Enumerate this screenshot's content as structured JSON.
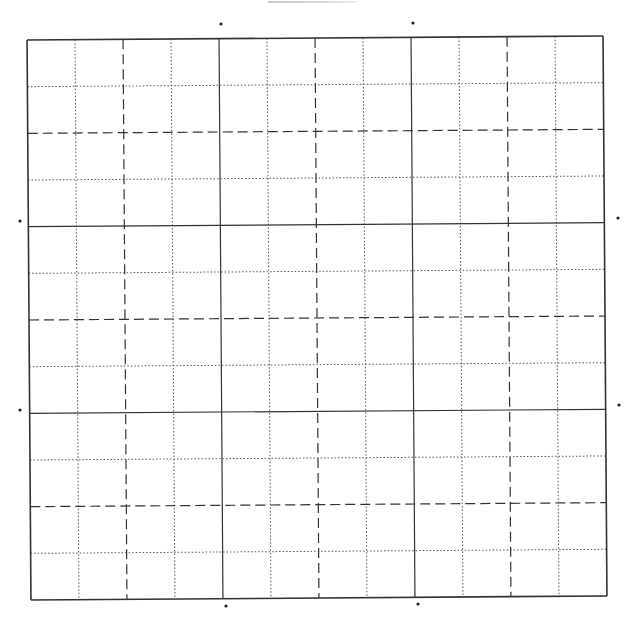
{
  "page": {
    "header_text": ""
  },
  "grid": {
    "origin": [
      29,
      38
    ],
    "width": 576,
    "height": 560,
    "rotation_deg": -0.4,
    "columns": 12,
    "rows": 12,
    "line_color": "#333333",
    "border_color": "#333333",
    "major_every": 4,
    "medium_every": 2,
    "styles": {
      "major": "solid",
      "medium": "dashed",
      "minor": "dotted"
    }
  },
  "markers": [
    {
      "name": "top-marker-1",
      "x": 221,
      "y": 24
    },
    {
      "name": "top-marker-2",
      "x": 413,
      "y": 23
    },
    {
      "name": "left-marker-1",
      "x": 20,
      "y": 221
    },
    {
      "name": "left-marker-2",
      "x": 20,
      "y": 410
    },
    {
      "name": "right-marker-1",
      "x": 618,
      "y": 218
    },
    {
      "name": "right-marker-2",
      "x": 619,
      "y": 405
    },
    {
      "name": "bottom-marker-1",
      "x": 226,
      "y": 606
    },
    {
      "name": "bottom-marker-2",
      "x": 418,
      "y": 604
    }
  ]
}
